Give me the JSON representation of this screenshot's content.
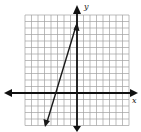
{
  "graph": {
    "x_axis_label": "x",
    "y_axis_label": "y",
    "grid": {
      "x_min": -8,
      "x_max": 8,
      "y_min": -5,
      "y_max": 12,
      "cell_px": 6.5,
      "origin_px": [
        77,
        93
      ]
    },
    "line": {
      "description": "straight line with arrowheads at both ends",
      "approx_equation": "y = 3x + 10",
      "endpoint_upper": [
        0,
        10.5
      ],
      "endpoint_lower": [
        -5,
        -5
      ],
      "x_intercept_approx": -3.3
    },
    "colors": {
      "grid": "#9a9a9a",
      "axes": "#111111",
      "line": "#1a1a1a",
      "background": "#ffffff"
    }
  }
}
